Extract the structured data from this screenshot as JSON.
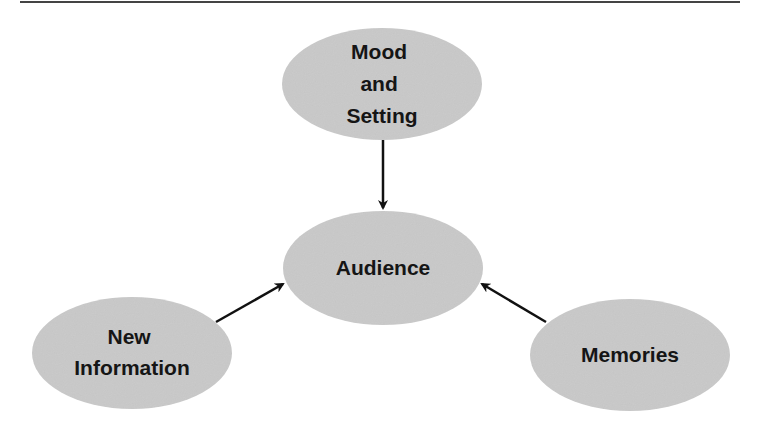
{
  "diagram": {
    "colors": {
      "node_fill": "#c9c9c9",
      "arrow": "#111111",
      "rule": "#444444",
      "background": "#ffffff"
    },
    "nodes": [
      {
        "id": "mood",
        "lines": [
          "Mood",
          "and",
          "Setting"
        ]
      },
      {
        "id": "audience",
        "lines": [
          "Audience"
        ]
      },
      {
        "id": "new_info",
        "lines": [
          "New",
          "Information"
        ]
      },
      {
        "id": "memories",
        "lines": [
          "Memories"
        ]
      }
    ],
    "edges": [
      {
        "from": "Mood and Setting",
        "to": "Audience"
      },
      {
        "from": "New Information",
        "to": "Audience"
      },
      {
        "from": "Memories",
        "to": "Audience"
      }
    ]
  }
}
